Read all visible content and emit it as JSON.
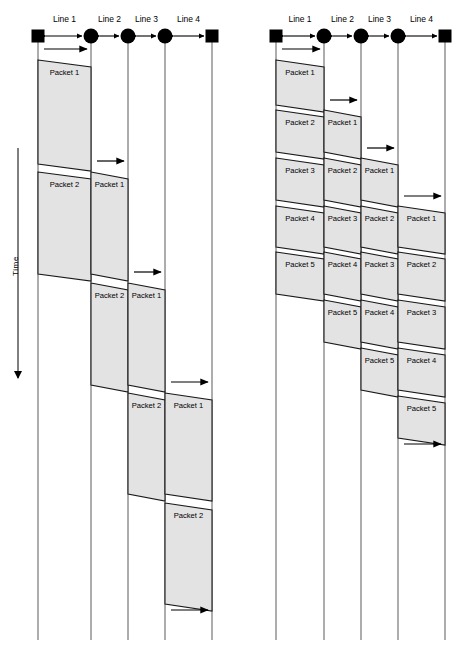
{
  "figure": {
    "title": "",
    "time_axis_label": "Time",
    "colors": {
      "packet_fill": "#e3e3e3",
      "packet_stroke": "#1a1a1a",
      "hop_line": "#5a5a5a",
      "node": "#000000",
      "background": "#ffffff"
    },
    "line_labels": [
      "Line 1",
      "Line 2",
      "Line 3",
      "Line 4"
    ],
    "node_shapes": [
      "square",
      "circle",
      "circle",
      "circle",
      "square"
    ],
    "diagrams": [
      {
        "name": "large-packets",
        "packet_count": 2,
        "line_labels": [
          "Line 1",
          "Line 2",
          "Line 3",
          "Line 4"
        ],
        "hops": [
          {
            "line": "Line 1",
            "blocks": [
              {
                "label": "Packet 1",
                "top": 60,
                "bottom": 164,
                "arrow_y": 49
              },
              {
                "label": "Packet 2",
                "top": 172,
                "bottom": 274,
                "arrow_y": 163
              }
            ]
          },
          {
            "line": "Line 2",
            "blocks": [
              {
                "label": "Packet 1",
                "top": 172,
                "bottom": 274,
                "arrow_y": 161
              },
              {
                "label": "Packet 2",
                "top": 283,
                "bottom": 385,
                "arrow_y": 273
              }
            ]
          },
          {
            "line": "Line 3",
            "blocks": [
              {
                "label": "Packet 1",
                "top": 283,
                "bottom": 385,
                "arrow_y": 272
              },
              {
                "label": "Packet 2",
                "top": 393,
                "bottom": 494,
                "arrow_y": 384
              }
            ]
          },
          {
            "line": "Line 4",
            "blocks": [
              {
                "label": "Packet 1",
                "top": 393,
                "bottom": 494,
                "arrow_y": 382
              },
              {
                "label": "Packet 2",
                "top": 503,
                "bottom": 604,
                "arrow_y": 493
              }
            ]
          }
        ],
        "trailing_arrows": [
          {
            "line": "Line 4",
            "arrow_y": 603
          }
        ]
      },
      {
        "name": "small-packets",
        "packet_count": 5,
        "line_labels": [
          "Line 1",
          "Line 2",
          "Line 3",
          "Line 4"
        ],
        "hops": [
          {
            "line": "Line 1",
            "blocks": [
              {
                "label": "Packet 1",
                "top": 60,
                "bottom": 105,
                "arrow_y": 49
              },
              {
                "label": "Packet 2",
                "top": 110,
                "bottom": 152,
                "arrow_y": 104
              },
              {
                "label": "Packet 3",
                "top": 158,
                "bottom": 200,
                "arrow_y": 152
              },
              {
                "label": "Packet 4",
                "top": 206,
                "bottom": 247,
                "arrow_y": 199
              },
              {
                "label": "Packet 5",
                "top": 252,
                "bottom": 294,
                "arrow_y": 247
              }
            ]
          },
          {
            "line": "Line 2",
            "blocks": [
              {
                "label": "Packet 1",
                "top": 110,
                "bottom": 152,
                "arrow_y": 100
              },
              {
                "label": "Packet 2",
                "top": 158,
                "bottom": 200,
                "arrow_y": 151
              },
              {
                "label": "Packet 3",
                "top": 206,
                "bottom": 247,
                "arrow_y": 199
              },
              {
                "label": "Packet 4",
                "top": 252,
                "bottom": 294,
                "arrow_y": 247
              },
              {
                "label": "Packet 5",
                "top": 300,
                "bottom": 342,
                "arrow_y": 294
              }
            ]
          },
          {
            "line": "Line 3",
            "blocks": [
              {
                "label": "Packet 1",
                "top": 158,
                "bottom": 200,
                "arrow_y": 148
              },
              {
                "label": "Packet 2",
                "top": 206,
                "bottom": 247,
                "arrow_y": 199
              },
              {
                "label": "Packet 3",
                "top": 252,
                "bottom": 294,
                "arrow_y": 246
              },
              {
                "label": "Packet 4",
                "top": 300,
                "bottom": 342,
                "arrow_y": 294
              },
              {
                "label": "Packet 5",
                "top": 348,
                "bottom": 390,
                "arrow_y": 342
              }
            ]
          },
          {
            "line": "Line 4",
            "blocks": [
              {
                "label": "Packet 1",
                "top": 206,
                "bottom": 247,
                "arrow_y": 196
              },
              {
                "label": "Packet 2",
                "top": 252,
                "bottom": 294,
                "arrow_y": 246
              },
              {
                "label": "Packet 3",
                "top": 300,
                "bottom": 342,
                "arrow_y": 294
              },
              {
                "label": "Packet 4",
                "top": 348,
                "bottom": 390,
                "arrow_y": 341
              },
              {
                "label": "Packet 5",
                "top": 396,
                "bottom": 438,
                "arrow_y": 389
              }
            ]
          }
        ],
        "trailing_arrows": [
          {
            "line": "Line 4",
            "arrow_y": 437
          }
        ]
      }
    ]
  }
}
